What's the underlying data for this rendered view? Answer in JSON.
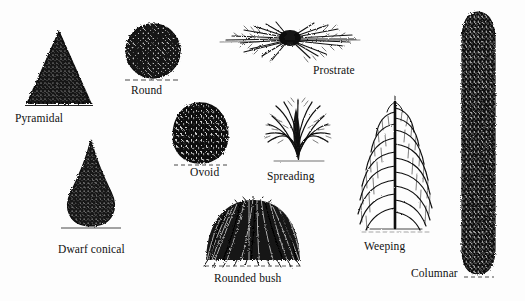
{
  "figure": {
    "background_color": "#fdfdfd",
    "ink_color": "#111111",
    "style": "black ink stipple illustrations on white background"
  },
  "forms": [
    {
      "id": "pyramidal",
      "label": "Pyramidal",
      "icon": "pyramidal-tree-icon",
      "shape": "triangle",
      "label_x": 15,
      "label_y": 112,
      "shape_x": 24,
      "shape_y": 30,
      "shape_w": 70,
      "shape_h": 78
    },
    {
      "id": "round",
      "label": "Round",
      "icon": "round-tree-icon",
      "shape": "circle",
      "label_x": 131,
      "label_y": 84,
      "shape_x": 122,
      "shape_y": 22,
      "shape_w": 62,
      "shape_h": 60
    },
    {
      "id": "prostrate",
      "label": "Prostrate",
      "icon": "prostrate-shrub-icon",
      "shape": "low-spreading",
      "label_x": 313,
      "label_y": 65,
      "shape_x": 216,
      "shape_y": 18,
      "shape_w": 146,
      "shape_h": 48
    },
    {
      "id": "ovoid",
      "label": "Ovoid",
      "icon": "ovoid-tree-icon",
      "shape": "ellipse",
      "label_x": 190,
      "label_y": 166,
      "shape_x": 170,
      "shape_y": 102,
      "shape_w": 60,
      "shape_h": 62
    },
    {
      "id": "spreading",
      "label": "Spreading",
      "icon": "spreading-shrub-icon",
      "shape": "fan",
      "label_x": 267,
      "label_y": 170,
      "shape_x": 260,
      "shape_y": 96,
      "shape_w": 76,
      "shape_h": 70
    },
    {
      "id": "dwarf-conical",
      "label": "Dwarf conical",
      "icon": "dwarf-conical-tree-icon",
      "shape": "teardrop-cone",
      "label_x": 58,
      "label_y": 243,
      "shape_x": 57,
      "shape_y": 140,
      "shape_w": 68,
      "shape_h": 92
    },
    {
      "id": "rounded-bush",
      "label": "Rounded bush",
      "icon": "rounded-bush-icon",
      "shape": "dome",
      "label_x": 214,
      "label_y": 272,
      "shape_x": 203,
      "shape_y": 198,
      "shape_w": 100,
      "shape_h": 70
    },
    {
      "id": "weeping",
      "label": "Weeping",
      "icon": "weeping-tree-icon",
      "shape": "weeping",
      "label_x": 364,
      "label_y": 240,
      "shape_x": 352,
      "shape_y": 96,
      "shape_w": 86,
      "shape_h": 140
    },
    {
      "id": "columnar",
      "label": "Columnar",
      "icon": "columnar-tree-icon",
      "shape": "column",
      "label_x": 411,
      "label_y": 267,
      "shape_x": 459,
      "shape_y": 12,
      "shape_w": 36,
      "shape_h": 265
    }
  ]
}
